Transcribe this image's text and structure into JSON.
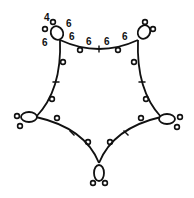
{
  "diagram": {
    "type": "tatting-pattern",
    "stroke_color": "#111111",
    "background": "#ffffff",
    "labels": [
      {
        "text": "4",
        "x": 44,
        "y": 21,
        "meaning": "stitch-count"
      },
      {
        "text": "6",
        "x": 66,
        "y": 27,
        "meaning": "stitch-count"
      },
      {
        "text": "6",
        "x": 42,
        "y": 46,
        "meaning": "stitch-count"
      },
      {
        "text": "6",
        "x": 69,
        "y": 40,
        "meaning": "stitch-count"
      },
      {
        "text": "6",
        "x": 86,
        "y": 45,
        "meaning": "stitch-count"
      },
      {
        "text": "6",
        "x": 104,
        "y": 45,
        "meaning": "stitch-count"
      },
      {
        "text": "6",
        "x": 122,
        "y": 40,
        "meaning": "stitch-count"
      }
    ],
    "rings": [
      {
        "name": "ring-top-left",
        "cx": 57,
        "cy": 33,
        "rx": 6,
        "ry": 7,
        "rot": -30,
        "picots": [
          [
            45,
            29
          ],
          [
            53,
            22
          ]
        ]
      },
      {
        "name": "ring-top-right",
        "cx": 144,
        "cy": 32,
        "rx": 6,
        "ry": 7,
        "rot": 30,
        "picots": [
          [
            145,
            22
          ],
          [
            153,
            29
          ]
        ]
      },
      {
        "name": "ring-left",
        "cx": 29,
        "cy": 117,
        "rx": 8,
        "ry": 5,
        "rot": 0,
        "picots": [
          [
            17,
            116
          ],
          [
            20,
            126
          ]
        ]
      },
      {
        "name": "ring-right",
        "cx": 167,
        "cy": 119,
        "rx": 8,
        "ry": 5,
        "rot": 0,
        "picots": [
          [
            180,
            117
          ],
          [
            177,
            127
          ]
        ]
      },
      {
        "name": "ring-bottom",
        "cx": 99,
        "cy": 173,
        "rx": 5,
        "ry": 8,
        "rot": 0,
        "picots": [
          [
            93,
            183
          ],
          [
            105,
            183
          ]
        ]
      }
    ],
    "chains": [
      {
        "name": "chain-top",
        "path": "M60 40 Q99 58 138 40",
        "tick": [
          99,
          49
        ],
        "picots": [
          [
            80,
            50
          ],
          [
            118,
            50
          ]
        ]
      },
      {
        "name": "chain-left-upper",
        "path": "M60 40 Q62 90 36 117",
        "tick": [
          56,
          82
        ],
        "picots": [
          [
            63,
            62
          ],
          [
            52,
            99
          ]
        ]
      },
      {
        "name": "chain-right-upper",
        "path": "M138 40 Q136 90 161 117",
        "tick": [
          142,
          82
        ],
        "picots": [
          [
            134,
            62
          ],
          [
            146,
            99
          ]
        ]
      },
      {
        "name": "chain-left-lower",
        "path": "M36 117 Q85 128 99 163",
        "tick": [
          72,
          133
        ],
        "picots": [
          [
            57,
            118
          ],
          [
            88,
            142
          ]
        ]
      },
      {
        "name": "chain-right-lower",
        "path": "M161 117 Q113 128 99 163",
        "tick": [
          126,
          133
        ],
        "picots": [
          [
            141,
            118
          ],
          [
            110,
            142
          ]
        ]
      }
    ]
  }
}
